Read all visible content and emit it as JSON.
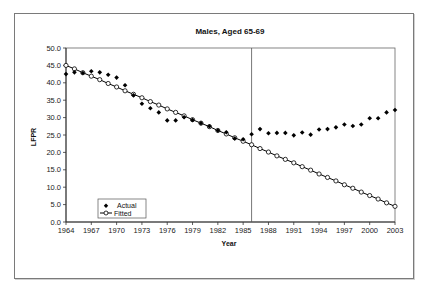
{
  "chart_data": {
    "type": "scatter",
    "title": "Males, Aged 65-69",
    "xlabel": "Year",
    "ylabel": "LFPR",
    "xlim": [
      1964,
      2003
    ],
    "ylim": [
      0,
      50
    ],
    "x_ticks": [
      "1964",
      "1967",
      "1970",
      "1973",
      "1976",
      "1979",
      "1982",
      "1985",
      "1988",
      "1991",
      "1994",
      "1997",
      "2000",
      "2003"
    ],
    "y_ticks": [
      "0.0",
      "5.0",
      "10.0",
      "15.0",
      "20.0",
      "25.0",
      "30.0",
      "35.0",
      "40.0",
      "45.0",
      "50.0"
    ],
    "grid": false,
    "legend": {
      "position": "bottom-left",
      "entries": [
        "Actual",
        "Fitted"
      ]
    },
    "reference_line_year": 1986,
    "x": [
      1964,
      1965,
      1966,
      1967,
      1968,
      1969,
      1970,
      1971,
      1972,
      1973,
      1974,
      1975,
      1976,
      1977,
      1978,
      1979,
      1980,
      1981,
      1982,
      1983,
      1984,
      1985,
      1986,
      1987,
      1988,
      1989,
      1990,
      1991,
      1992,
      1993,
      1994,
      1995,
      1996,
      1997,
      1998,
      1999,
      2000,
      2001,
      2002,
      2003
    ],
    "series": [
      {
        "name": "Actual",
        "marker": "diamond-filled",
        "line": false,
        "values": [
          42.5,
          43.0,
          42.8,
          43.3,
          43.0,
          42.3,
          41.5,
          39.3,
          36.4,
          34.0,
          32.7,
          31.5,
          29.2,
          29.2,
          30.1,
          29.3,
          28.4,
          27.5,
          26.3,
          25.8,
          24.0,
          23.8,
          25.2,
          26.7,
          25.5,
          25.6,
          25.6,
          24.9,
          25.7,
          25.1,
          26.6,
          26.7,
          27.2,
          28.0,
          27.6,
          28.0,
          29.8,
          29.8,
          31.5,
          32.2
        ]
      },
      {
        "name": "Fitted",
        "marker": "circle-open",
        "line": true,
        "values": [
          45.0,
          44.0,
          42.9,
          41.9,
          40.9,
          39.8,
          38.8,
          37.7,
          36.7,
          35.7,
          34.6,
          33.6,
          32.5,
          31.5,
          30.5,
          29.4,
          28.4,
          27.4,
          26.3,
          25.3,
          24.2,
          23.2,
          22.2,
          21.1,
          20.1,
          19.0,
          18.0,
          17.0,
          15.9,
          14.9,
          13.8,
          12.8,
          11.8,
          10.7,
          9.7,
          8.6,
          7.6,
          6.6,
          5.5,
          4.5
        ]
      }
    ]
  }
}
